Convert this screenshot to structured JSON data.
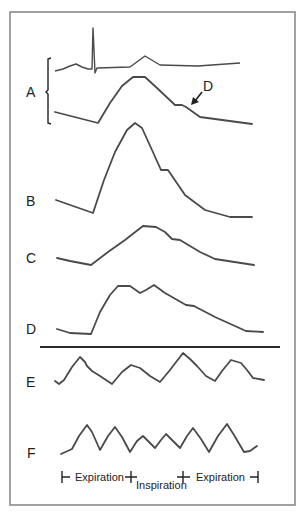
{
  "figure": {
    "frame_color": "#8a8a8a",
    "trace_color": "#4a4a4a"
  },
  "labels": {
    "A": "A",
    "B": "B",
    "C": "C",
    "D": "D",
    "E": "E",
    "F": "F",
    "annotation": "D"
  },
  "phases": {
    "left": "Expiration",
    "middle": "Inspiration",
    "right": "Expiration"
  },
  "traces": {
    "A_ecg": "M55,71 L63,69 L70,66 L76,64 L82,67 L88,69 L92,69 L93,28 L95,73 L97,68 L130,67 L145,56 L160,65 L198,66 L240,63",
    "A_pulse": "M55,112 L98,123 L110,103 L122,86 L133,77 L145,77 L157,88 L175,105 L182,105 L186,107 L200,117 L252,124",
    "B": "M56,200 L93,213 L104,180 L115,152 L127,130 L135,123 L142,128 L152,150 L161,170 L168,170 L185,195 L205,210 L230,217 L252,217",
    "C": "M57,258 L70,261 L91,265 L108,252 L125,240 L143,226 L156,227 L165,232 L172,239 L180,240 L200,252 L215,259 L254,265",
    "D": "M57,329 L70,333 L91,334 L100,312 L110,295 L118,286 L130,286 L140,293 L146,290 L154,285 L165,293 L186,305 L194,306 L215,317 L246,331 L263,332",
    "E": "M55,381 L59,384 L64,380 L72,367 L80,357 L85,362 L87,366 L92,371 L100,376 L112,384 L122,372 L131,365 L140,368 L150,376 L160,382 L170,370 L183,353 L190,359 L197,366 L206,376 L215,381 L222,371 L231,360 L241,363 L247,370 L253,378 L264,380",
    "F": "M61,454 L72,449 L79,436 L87,425 L92,432 L100,450 L108,436 L115,427 L122,437 L130,452 L137,441 L143,436 L149,442 L155,448 L161,440 L166,434 L173,441 L180,448 L187,436 L193,428 L201,439 L209,452 L218,436 L227,424 L234,435 L244,452 L250,451 L257,446"
  }
}
